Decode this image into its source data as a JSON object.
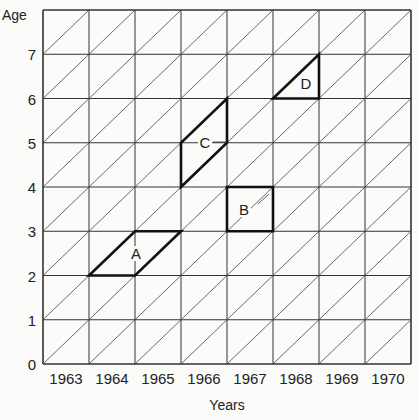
{
  "diagram": {
    "type": "lexis-diagram",
    "y_axis": {
      "title": "Age",
      "ticks": [
        "0",
        "1",
        "2",
        "3",
        "4",
        "5",
        "6",
        "7"
      ]
    },
    "x_axis": {
      "title": "Years",
      "ticks": [
        "1963",
        "1964",
        "1965",
        "1966",
        "1967",
        "1968",
        "1969",
        "1970"
      ]
    },
    "grid": {
      "columns": 8,
      "rows": 8,
      "diagonals": true
    },
    "shapes": [
      {
        "label": "A",
        "kind": "parallelogram",
        "points": [
          [
            1,
            2
          ],
          [
            2,
            2
          ],
          [
            3,
            3
          ],
          [
            2,
            3
          ]
        ]
      },
      {
        "label": "B",
        "kind": "square",
        "points": [
          [
            4,
            3
          ],
          [
            5,
            3
          ],
          [
            5,
            4
          ],
          [
            4,
            4
          ]
        ]
      },
      {
        "label": "C",
        "kind": "parallelogram",
        "points": [
          [
            3,
            4
          ],
          [
            4,
            5
          ],
          [
            4,
            6
          ],
          [
            3,
            5
          ]
        ]
      },
      {
        "label": "D",
        "kind": "triangle",
        "points": [
          [
            5,
            6
          ],
          [
            6,
            6
          ],
          [
            6,
            7
          ]
        ]
      }
    ]
  }
}
